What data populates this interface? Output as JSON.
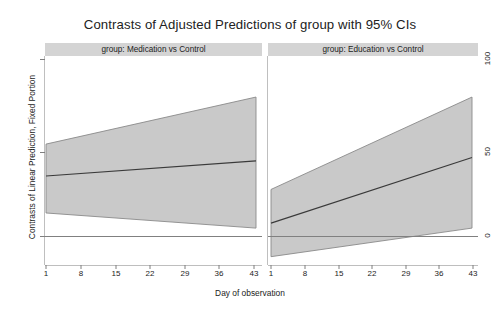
{
  "title": "Contrasts of Adjusted Predictions of group with 95% CIs",
  "axes": {
    "y_title": "Contrasts of Linear Prediction, Fixed Portion",
    "x_title": "Day of observation",
    "y_ticks": [
      "0",
      "50",
      "100"
    ],
    "x_ticks": [
      "1",
      "8",
      "15",
      "22",
      "29",
      "36",
      "43"
    ]
  },
  "panels": [
    {
      "header": "group: Medication vs Control"
    },
    {
      "header": "group: Education vs Control"
    }
  ],
  "colors": {
    "ci_band": "#c9c9c9",
    "ci_band_edge": "#8a8a8a",
    "prediction_line": "#3a3a3a",
    "zero_line": "#808080",
    "panel_header_bg": "#d4d4d4",
    "frame": "#7f7f7f",
    "background": "#ffffff"
  },
  "chart_data": {
    "type": "line",
    "title": "Contrasts of Adjusted Predictions of group with 95% CIs",
    "xlabel": "Day of observation",
    "ylabel": "Contrasts of Linear Prediction, Fixed Portion",
    "xlim": [
      1,
      45
    ],
    "ylim": [
      -20,
      105
    ],
    "x_ticks": [
      1,
      8,
      15,
      22,
      29,
      36,
      43
    ],
    "y_ticks": [
      0,
      50,
      100
    ],
    "grid": false,
    "legend": "none",
    "reference_line": {
      "y": 0,
      "style": "solid",
      "color": "#808080"
    },
    "facets": [
      {
        "name": "group: Medication vs Control",
        "x": [
          1,
          45
        ],
        "estimate": [
          36,
          45
        ],
        "ci_lower": [
          14,
          5
        ],
        "ci_upper": [
          55,
          83
        ]
      },
      {
        "name": "group: Education vs Control",
        "x": [
          1,
          45
        ],
        "estimate": [
          8,
          47
        ],
        "ci_lower": [
          -12,
          5
        ],
        "ci_upper": [
          28,
          83
        ]
      }
    ]
  }
}
